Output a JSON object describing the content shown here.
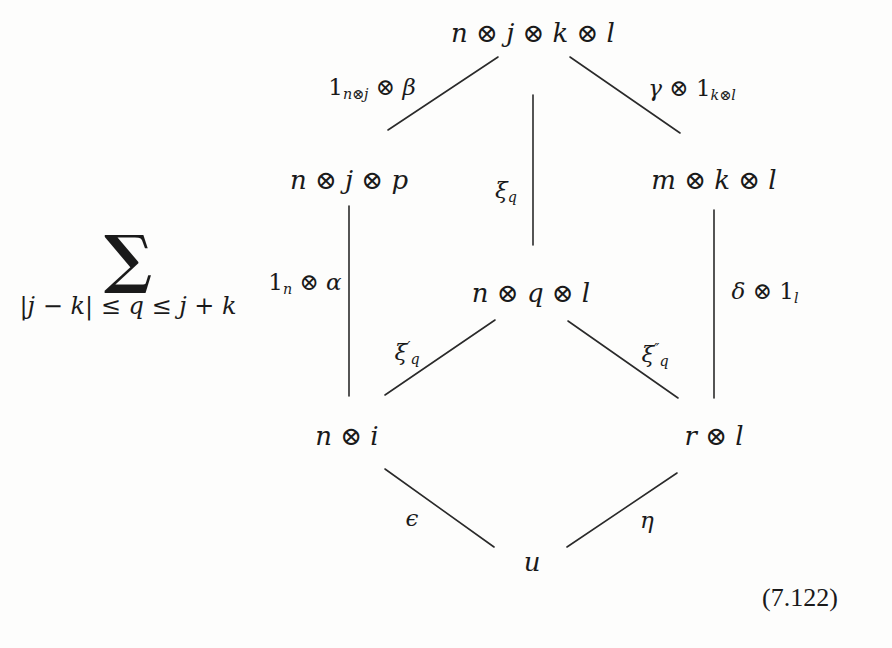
{
  "diagram": {
    "summation": {
      "symbol": "∑",
      "range": "|j − k| ≤ q ≤ j + k"
    },
    "nodes": {
      "top": {
        "text": "n ⊗ j ⊗ k ⊗ l"
      },
      "upper_left": {
        "text": "n ⊗ j ⊗ p"
      },
      "upper_right": {
        "text": "m ⊗ k ⊗ l"
      },
      "center": {
        "text": "n ⊗ q ⊗ l"
      },
      "lower_left": {
        "text": "n ⊗ i"
      },
      "lower_right": {
        "text": "r ⊗ l"
      },
      "bottom": {
        "text": "u"
      }
    },
    "edges": {
      "top_to_upper_left": {
        "base": "1",
        "sub": "n⊗j",
        "rest": " ⊗ β"
      },
      "top_to_upper_right": {
        "pre": "γ ⊗ ",
        "base": "1",
        "sub": "k⊗l"
      },
      "top_to_center": {
        "base": "ξ",
        "sub": "q"
      },
      "upper_left_to_lower_left": {
        "base": "1",
        "sub": "n",
        "rest": " ⊗ α"
      },
      "upper_right_to_lower_right": {
        "pre": "δ ⊗ ",
        "base": "1",
        "sub": "l"
      },
      "center_to_lower_left": {
        "base": "ξ",
        "sup": "′",
        "sub": "q"
      },
      "center_to_lower_right": {
        "base": "ξ",
        "sup": "″",
        "sub": "q"
      },
      "lower_left_to_bottom": {
        "base": "ϵ"
      },
      "lower_right_to_bottom": {
        "base": "η"
      }
    },
    "equation_number": "(7.122)",
    "line_color": "#2a2a2a"
  }
}
